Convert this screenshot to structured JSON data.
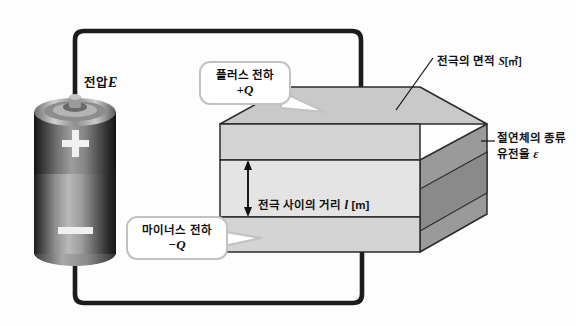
{
  "diagram": {
    "labels": {
      "voltage": {
        "text": "전압",
        "symbol": "E"
      },
      "electrode_area": {
        "text": "전극의 면적",
        "symbol": "S",
        "unit": "[㎡]"
      },
      "dielectric": {
        "line1": "절연체의 종류",
        "line2_text": "유전율",
        "line2_symbol": "ε"
      },
      "plate_distance": {
        "text": "전극 사이의 거리",
        "symbol": "l",
        "unit": "[m]"
      }
    },
    "callouts": [
      {
        "name": "plus-charge",
        "line1": "플러스 전하",
        "line2": "+Q"
      },
      {
        "name": "minus-charge",
        "line1": "마이너스 전하",
        "line2": "−Q"
      }
    ],
    "battery": {
      "plus_symbol": "+",
      "minus_symbol": "−"
    },
    "colors": {
      "wire": "#1c1c1c",
      "plate_top_face": "#c9c9c9",
      "plate_front": "#d6d6d6",
      "dielectric_front": "#e2e2e2",
      "side_face": "#9a9a9a",
      "side_dielectric": "#8c8c8c",
      "outline": "#2b2b2b",
      "callout_border": "#c2c2c2",
      "label_text": "#101010"
    }
  }
}
